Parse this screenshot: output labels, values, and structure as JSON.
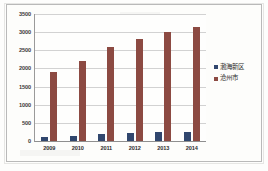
{
  "chart_data": {
    "type": "bar",
    "title": "",
    "subtitle": "",
    "xlabel": "",
    "ylabel": "",
    "categories": [
      "2009",
      "2010",
      "2011",
      "2012",
      "2013",
      "2014"
    ],
    "series": [
      {
        "name": "渤海新区",
        "color": "#31476E",
        "values": [
          100,
          150,
          200,
          230,
          240,
          240
        ]
      },
      {
        "name": "沧州市",
        "color": "#8C4A42",
        "values": [
          1900,
          2200,
          2600,
          2820,
          3000,
          3150
        ]
      }
    ],
    "ylim": [
      0,
      3500
    ],
    "ytick_labels": [
      "0",
      "500",
      "1000",
      "1500",
      "2000",
      "2500",
      "3000",
      "3500"
    ],
    "ytick_values": [
      0,
      500,
      1000,
      1500,
      2000,
      2500,
      3000,
      3500
    ],
    "grid": true,
    "legend_position": "right",
    "legend": [
      {
        "label": "渤海新区",
        "color": "#31476E"
      },
      {
        "label": "沧州市",
        "color": "#8C4A42"
      }
    ]
  }
}
